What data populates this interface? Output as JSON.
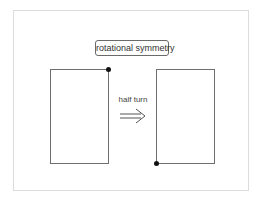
{
  "diagram": {
    "title": "rotational symmetry",
    "transformation_label": "half turn",
    "shapes": [
      {
        "name": "original-rectangle",
        "marked_corner": "top-right"
      },
      {
        "name": "rotated-rectangle",
        "marked_corner": "bottom-left"
      }
    ],
    "arrow_icon": "double-arrow-right-icon",
    "colors": {
      "outline": "#6e6e6e",
      "marker": "#111111",
      "frame": "#dcdcdc"
    }
  }
}
